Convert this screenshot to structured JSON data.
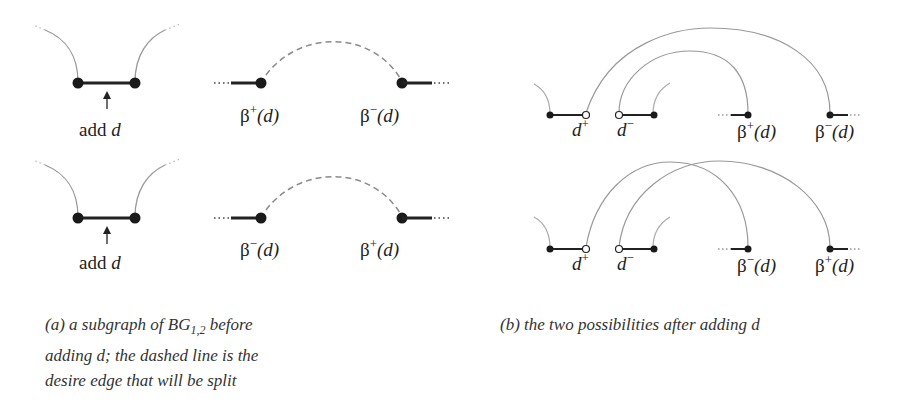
{
  "panel_a": {
    "rows": [
      {
        "add_label_prefix": "add",
        "add_label_var": "d",
        "left_node": {
          "symbol": "β",
          "sign": "+",
          "arg": "(d)"
        },
        "right_node": {
          "symbol": "β",
          "sign": "−",
          "arg": "(d)"
        }
      },
      {
        "add_label_prefix": "add",
        "add_label_var": "d",
        "left_node": {
          "symbol": "β",
          "sign": "−",
          "arg": "(d)"
        },
        "right_node": {
          "symbol": "β",
          "sign": "+",
          "arg": "(d)"
        }
      }
    ],
    "caption": {
      "line1_pre": "(a) a subgraph of BG",
      "line1_sub": "1,2",
      "line1_post": " before",
      "line2": "adding d; the dashed line is the",
      "line3": "desire edge that will be split"
    }
  },
  "panel_b": {
    "rows": [
      {
        "d_plus": {
          "var": "d",
          "sign": "+"
        },
        "d_minus": {
          "var": "d",
          "sign": "−"
        },
        "beta_left": {
          "symbol": "β",
          "sign": "+",
          "arg": "(d)"
        },
        "beta_right": {
          "symbol": "β",
          "sign": "−",
          "arg": "(d)"
        }
      },
      {
        "d_plus": {
          "var": "d",
          "sign": "+"
        },
        "d_minus": {
          "var": "d",
          "sign": "−"
        },
        "beta_left": {
          "symbol": "β",
          "sign": "−",
          "arg": "(d)"
        },
        "beta_right": {
          "symbol": "β",
          "sign": "+",
          "arg": "(d)"
        }
      }
    ],
    "caption": "(b) the two possibilities after adding d"
  },
  "colors": {
    "edge": "#222222",
    "arc": "#9a9a9a",
    "dashed": "#8a8a8a",
    "node": "#1a1a1a"
  }
}
